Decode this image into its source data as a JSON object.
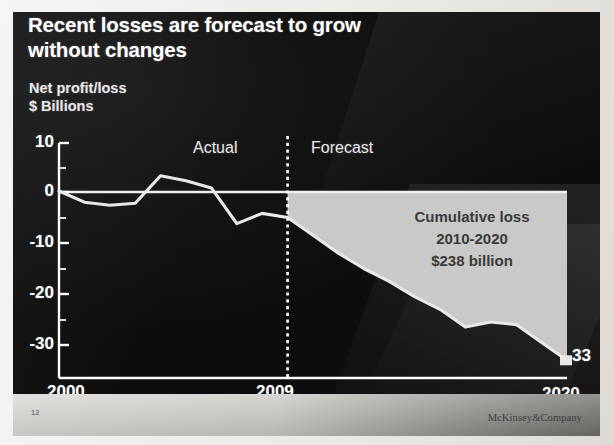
{
  "slide": {
    "title_lines": [
      "Recent losses are forecast to grow",
      "without changes"
    ],
    "axis_title_lines": [
      "Net profit/loss",
      "$ Billions"
    ],
    "slide_number": "12",
    "brand": "McKinsey&Company",
    "background_color": "#0d0d0e",
    "line_color": "#e8e8e8",
    "forecast_fill_color": "#c9c9c7"
  },
  "chart_data": {
    "type": "area",
    "title": "Recent losses are forecast to grow without changes",
    "subtitle": "Net profit/loss $ Billions",
    "xlabel": "",
    "ylabel": "Net profit/loss $ Billions",
    "xlim": [
      2000,
      2020
    ],
    "ylim": [
      -35,
      10
    ],
    "yticks": [
      10,
      0,
      -10,
      -20,
      -30
    ],
    "ytick_labels": [
      "10",
      "0",
      "-10",
      "-20",
      "-30"
    ],
    "y_minor_tick_interval": 5,
    "xticks": [
      2000,
      2009,
      2020
    ],
    "xtick_labels": [
      "2000",
      "2009",
      "2020"
    ],
    "grid": false,
    "legend": "none",
    "divider_year": 2009,
    "band_labels": [
      {
        "text": "Actual",
        "x": 2004.5
      },
      {
        "text": "Forecast",
        "x": 2013.5
      }
    ],
    "annotations": [
      {
        "text_lines": [
          "Cumulative loss",
          "2010-2020",
          "$238 billion"
        ],
        "x": 2015,
        "y": -12
      },
      {
        "text": "33",
        "x": 2020,
        "y": -33,
        "role": "endpoint-value"
      }
    ],
    "series": [
      {
        "name": "Net profit/loss",
        "segment": "actual",
        "x": [
          2000,
          2001,
          2002,
          2003,
          2004,
          2005,
          2006,
          2007,
          2008,
          2009
        ],
        "values": [
          0.2,
          -2.0,
          -2.6,
          -2.2,
          3.2,
          2.2,
          0.8,
          -6.2,
          -4.2,
          -5.0
        ]
      },
      {
        "name": "Net profit/loss",
        "segment": "forecast",
        "x": [
          2009,
          2010,
          2011,
          2012,
          2013,
          2014,
          2015,
          2016,
          2017,
          2018,
          2019,
          2020
        ],
        "values": [
          -5.0,
          -8.5,
          -12.0,
          -15.0,
          -17.5,
          -20.5,
          -23.0,
          -26.5,
          -25.5,
          -26.0,
          -29.5,
          -33.0
        ]
      }
    ],
    "cumulative_loss_2010_2020_billions": 238
  }
}
